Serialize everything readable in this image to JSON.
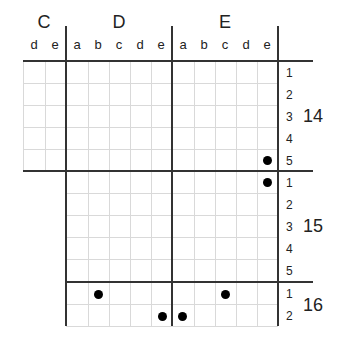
{
  "groups": [
    {
      "label": "C",
      "x": 44
    },
    {
      "label": "D",
      "x": 119
    },
    {
      "label": "E",
      "x": 225
    }
  ],
  "columns": [
    {
      "group": "C",
      "label": "d",
      "x": 34
    },
    {
      "group": "C",
      "label": "e",
      "x": 55
    },
    {
      "group": "D",
      "label": "a",
      "x": 77
    },
    {
      "group": "D",
      "label": "b",
      "x": 98
    },
    {
      "group": "D",
      "label": "c",
      "x": 119
    },
    {
      "group": "D",
      "label": "d",
      "x": 140
    },
    {
      "group": "D",
      "label": "e",
      "x": 161
    },
    {
      "group": "E",
      "label": "a",
      "x": 183
    },
    {
      "group": "E",
      "label": "b",
      "x": 204
    },
    {
      "group": "E",
      "label": "c",
      "x": 225
    },
    {
      "group": "E",
      "label": "d",
      "x": 246
    },
    {
      "group": "E",
      "label": "e",
      "x": 267
    }
  ],
  "blocks": [
    {
      "label": "14",
      "rows": [
        "1",
        "2",
        "3",
        "4",
        "5"
      ]
    },
    {
      "label": "15",
      "rows": [
        "1",
        "2",
        "3",
        "4",
        "5"
      ]
    },
    {
      "label": "16",
      "rows": [
        "1",
        "2"
      ]
    }
  ],
  "dots": [
    {
      "block": "14",
      "row": "5",
      "group": "E",
      "col": "e"
    },
    {
      "block": "15",
      "row": "1",
      "group": "E",
      "col": "e"
    },
    {
      "block": "16",
      "row": "1",
      "group": "D",
      "col": "b"
    },
    {
      "block": "16",
      "row": "1",
      "group": "E",
      "col": "c"
    },
    {
      "block": "16",
      "row": "2",
      "group": "D",
      "col": "e"
    },
    {
      "block": "16",
      "row": "2",
      "group": "E",
      "col": "a"
    }
  ]
}
